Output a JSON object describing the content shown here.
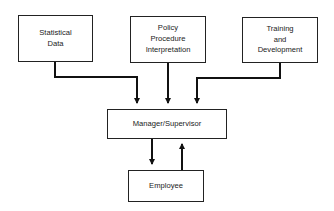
{
  "diagram": {
    "type": "flow",
    "nodes": [
      {
        "id": "statistical",
        "label": "Statistical\nData"
      },
      {
        "id": "policy",
        "label": "Policy\nProcedure\nInterpretation"
      },
      {
        "id": "training",
        "label": "Training\nand\nDevelopment"
      },
      {
        "id": "manager",
        "label": "Manager/Supervisor"
      },
      {
        "id": "employee",
        "label": "Employee"
      }
    ],
    "edges": [
      {
        "from": "statistical",
        "to": "manager"
      },
      {
        "from": "policy",
        "to": "manager"
      },
      {
        "from": "training",
        "to": "manager"
      },
      {
        "from": "manager",
        "to": "employee"
      },
      {
        "from": "employee",
        "to": "manager"
      }
    ],
    "colors": {
      "line": "#111111",
      "box_border": "#222222",
      "background": "#ffffff"
    }
  }
}
